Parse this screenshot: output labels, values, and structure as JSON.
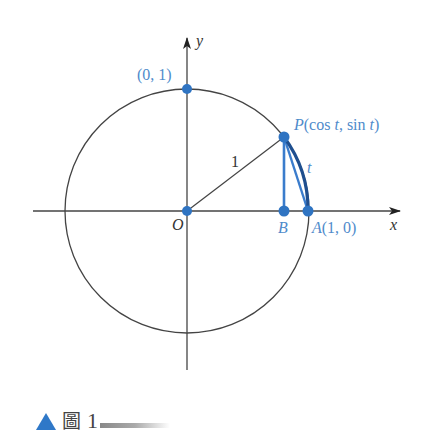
{
  "figure": {
    "labels": {
      "y_axis": "y",
      "x_axis": "x",
      "origin": "O",
      "point_top": "(0, 1)",
      "point_p_name": "P",
      "point_p_coords": "(cos t, sin t)",
      "point_p_prefix": "(cos ",
      "point_p_mid": ", sin ",
      "point_p_suffix": ")",
      "t": "t",
      "point_b": "B",
      "point_a": "A(1, 0)",
      "radius": "1",
      "arc": "t"
    },
    "colors": {
      "accent": "#2f74c2",
      "label_blue": "#4f8bcb",
      "line": "#333333"
    }
  },
  "caption": {
    "figure_char": "圖",
    "number": "1"
  }
}
